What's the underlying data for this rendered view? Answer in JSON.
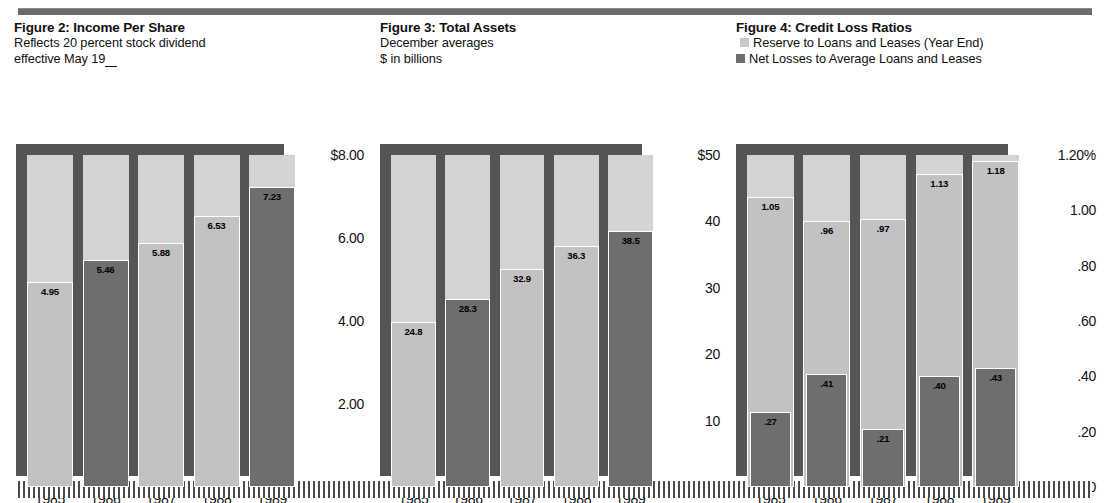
{
  "page": {
    "top_rule": "horizontal-rule",
    "bottom_band": "hatched-rule"
  },
  "figures": [
    {
      "id": "fig2",
      "title": "Figure 2: Income Per Share",
      "subtitle_lines": [
        "Reflects 20 percent stock dividend",
        "effective May 19"
      ],
      "legend": [],
      "chart_data": {
        "type": "bar",
        "title": "Figure 2: Income Per Share",
        "subtitle": "Reflects 20 percent stock dividend effective May 19__",
        "categories": [
          "1985",
          "1986",
          "1987",
          "1988",
          "1989"
        ],
        "values": [
          4.95,
          5.46,
          5.88,
          6.53,
          7.23
        ],
        "value_labels": [
          "4.95",
          "5.46",
          "5.88",
          "6.53",
          "7.23"
        ],
        "bar_shades": [
          "light",
          "dark",
          "light",
          "light",
          "dark"
        ],
        "xlabel": "",
        "ylabel": "",
        "ylim": [
          0,
          8
        ],
        "yticks": [
          8,
          6,
          4,
          2,
          0
        ],
        "ytick_labels": [
          "$8.00",
          "6.00",
          "4.00",
          "2.00",
          "0"
        ],
        "grid": false,
        "legend_position": "none"
      }
    },
    {
      "id": "fig3",
      "title": "Figure 3: Total Assets",
      "subtitle_lines": [
        "December averages",
        "$ in billions"
      ],
      "legend": [],
      "chart_data": {
        "type": "bar",
        "title": "Figure 3: Total Assets",
        "subtitle": "December averages / $ in billions",
        "categories": [
          "1985",
          "1986",
          "1987",
          "1988",
          "1989"
        ],
        "values": [
          24.8,
          28.3,
          32.9,
          36.3,
          38.5
        ],
        "value_labels": [
          "24.8",
          "28.3",
          "32.9",
          "36.3",
          "38.5"
        ],
        "bar_shades": [
          "light",
          "dark",
          "light",
          "light",
          "dark"
        ],
        "xlabel": "",
        "ylabel": "$ in billions",
        "ylim": [
          0,
          50
        ],
        "yticks": [
          50,
          40,
          30,
          20,
          10,
          0
        ],
        "ytick_labels": [
          "$50",
          "40",
          "30",
          "20",
          "10",
          "0"
        ],
        "grid": false,
        "legend_position": "none"
      }
    },
    {
      "id": "fig4",
      "title": "Figure 4: Credit Loss Ratios",
      "subtitle_lines": [],
      "legend": [
        {
          "swatch": "light",
          "label": "Reserve to Loans and Leases (Year End)"
        },
        {
          "swatch": "dark",
          "label": "Net Losses to Average Loans and Leases"
        }
      ],
      "chart_data": {
        "type": "bar",
        "title": "Figure 4: Credit Loss Ratios",
        "subtitle": "",
        "categories": [
          "1985",
          "1986",
          "1987",
          "1988",
          "1989"
        ],
        "series": [
          {
            "name": "Reserve to Loans and Leases (Year End)",
            "shade": "light",
            "values": [
              1.05,
              0.96,
              0.97,
              1.13,
              1.18
            ],
            "value_labels": [
              "1.05",
              ".96",
              ".97",
              "1.13",
              "1.18"
            ]
          },
          {
            "name": "Net Losses to Average Loans and Leases",
            "shade": "dark",
            "values": [
              0.27,
              0.41,
              0.21,
              0.4,
              0.43
            ],
            "value_labels": [
              ".27",
              ".41",
              ".21",
              ".40",
              ".43"
            ]
          }
        ],
        "xlabel": "",
        "ylabel": "percent",
        "ylim": [
          0,
          1.2
        ],
        "yticks": [
          1.2,
          1.0,
          0.8,
          0.6,
          0.4,
          0.2,
          0
        ],
        "ytick_labels": [
          "1.20%",
          "1.00",
          ".80",
          ".60",
          ".40",
          ".20",
          "0"
        ],
        "grid": false,
        "legend_position": "top"
      }
    }
  ],
  "colors": {
    "bar_light": "#c2c2c2",
    "bar_dark": "#6e6e6e",
    "band_light": "#d4d4d4",
    "plot_back": "#555555",
    "rule": "#6b6b6b",
    "text": "#111111"
  }
}
